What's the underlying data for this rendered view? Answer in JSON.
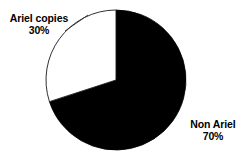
{
  "chart_data": {
    "type": "pie",
    "title": "",
    "subtitle": "",
    "xlabel": "",
    "ylabel": "",
    "grid": false,
    "legend_position": "none",
    "labels_on_chart": true,
    "start_angle_deg_from_12oclock": 0,
    "direction": "clockwise",
    "categories": [
      "Non Ariel",
      "Ariel copies"
    ],
    "values": [
      70,
      30
    ],
    "value_unit": "%",
    "slices": [
      {
        "label": "Non Ariel",
        "value": 70,
        "value_text": "70%",
        "color": "#000000",
        "outline_color": "#000000",
        "sweep_deg": 252,
        "label_position": "right-outside"
      },
      {
        "label": "Ariel copies",
        "value": 30,
        "value_text": "30%",
        "color": "#ffffff",
        "outline_color": "#1a1a1a",
        "sweep_deg": 108,
        "label_position": "left-outside"
      }
    ],
    "annotations": [
      {
        "name": "leader-line-ariel",
        "from_label": "Ariel copies",
        "description": "thin diagonal leader line from the Ariel copies label up-right to the pie arc"
      }
    ]
  },
  "labels": {
    "ariel": {
      "name": "Ariel copies",
      "value_text": "30%"
    },
    "non_ariel": {
      "name": "Non Ariel",
      "value_text": "70%"
    }
  },
  "colors": {
    "slice_dark": "#000000",
    "slice_light": "#ffffff",
    "outline": "#1a1a1a",
    "text": "#000000",
    "background": "#ffffff"
  },
  "geometry": {
    "center_x": 116,
    "center_y": 80,
    "radius": 70
  }
}
